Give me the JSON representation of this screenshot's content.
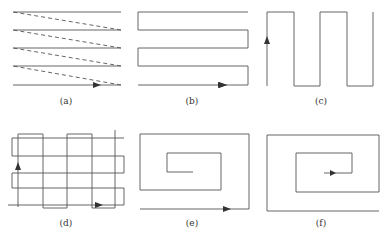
{
  "figure": {
    "panels": [
      {
        "id": "a",
        "label": "(a)",
        "pattern": "zigzag-with-dashed-return"
      },
      {
        "id": "b",
        "label": "(b)",
        "pattern": "serpentine-horizontal"
      },
      {
        "id": "c",
        "label": "(c)",
        "pattern": "serpentine-vertical"
      },
      {
        "id": "d",
        "label": "(d)",
        "pattern": "crosshatch-serpentine"
      },
      {
        "id": "e",
        "label": "(e)",
        "pattern": "spiral-inward"
      },
      {
        "id": "f",
        "label": "(f)",
        "pattern": "spiral-outward"
      }
    ],
    "colors": {
      "stroke": "#555555",
      "background": "#ffffff"
    }
  }
}
